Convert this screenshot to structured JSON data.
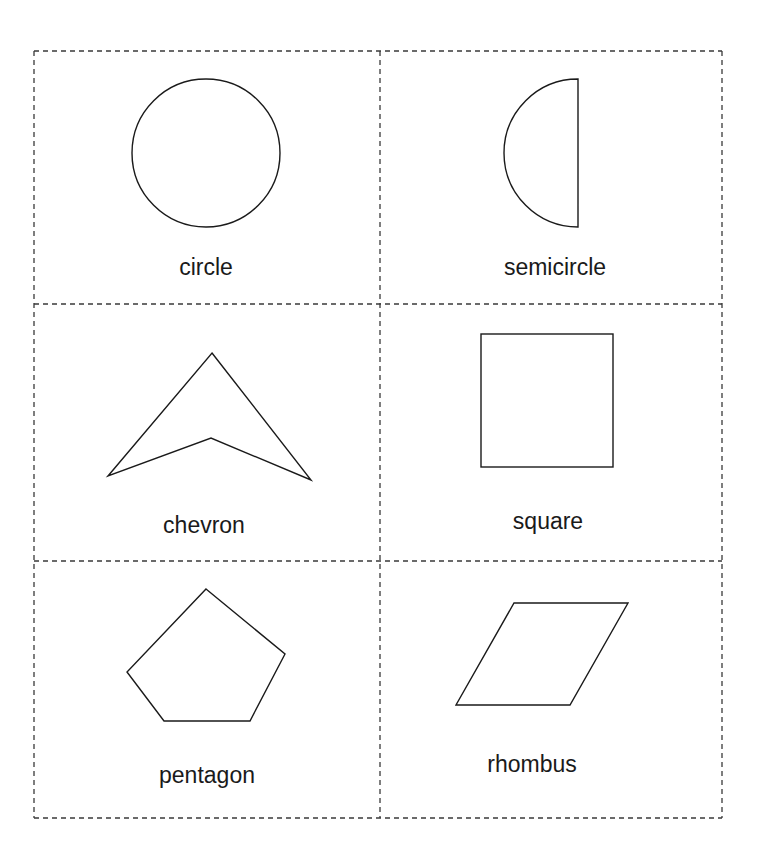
{
  "worksheet": {
    "layout": {
      "columns": 2,
      "rows": 3,
      "border_style": "dashed",
      "line_color": "#333333"
    },
    "cards": [
      {
        "shape": "circle",
        "label": "circle"
      },
      {
        "shape": "semicircle",
        "label": "semicircle"
      },
      {
        "shape": "chevron",
        "label": "chevron"
      },
      {
        "shape": "square",
        "label": "square"
      },
      {
        "shape": "pentagon",
        "label": "pentagon"
      },
      {
        "shape": "rhombus",
        "label": "rhombus"
      }
    ]
  }
}
